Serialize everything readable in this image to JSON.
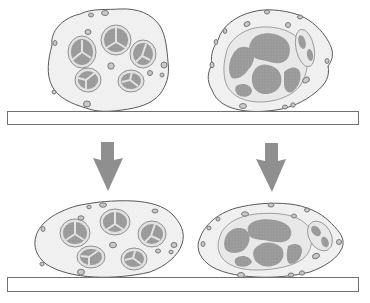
{
  "figure": {
    "type": "anatomical-illustration",
    "panels": [
      {
        "id": "oligo-before",
        "position": "top-left",
        "fascicle_count": 5,
        "state": "uncompressed"
      },
      {
        "id": "poly-before",
        "position": "top-right",
        "fascicle_count": 2,
        "state": "uncompressed"
      },
      {
        "id": "oligo-after",
        "position": "bottom-left",
        "fascicle_count": 5,
        "state": "compressed"
      },
      {
        "id": "poly-after",
        "position": "bottom-right",
        "fascicle_count": 2,
        "state": "compressed"
      }
    ],
    "arrows": [
      {
        "id": "arrow-left",
        "direction": "down"
      },
      {
        "id": "arrow-right",
        "direction": "down"
      }
    ],
    "surfaces": [
      {
        "id": "surface-top"
      },
      {
        "id": "surface-bottom"
      }
    ]
  },
  "colors": {
    "background": "#ffffff",
    "outline": "#5a5a5a",
    "epineurium_fill": "#f1f1f1",
    "perineurium_fill": "#e4e4e4",
    "fascicle_core": "#9a9a9a",
    "vessel_ring": "#8a8a8a",
    "vessel_core": "#c8c8c8",
    "arrow": "#8f8f8f",
    "surface_fill": "#ffffff",
    "surface_stroke": "#707070"
  }
}
